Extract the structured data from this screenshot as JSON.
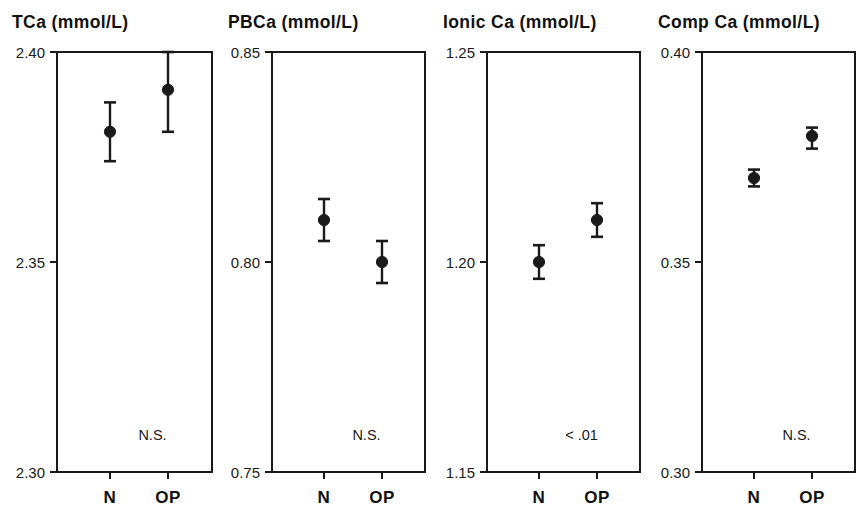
{
  "figure": {
    "caption": "",
    "background_color": "#ffffff",
    "ink_color": "#1a1a1a"
  },
  "chart_data": [
    {
      "type": "scatter",
      "title": "TCa  (mmol/L)",
      "xlabel": "",
      "ylabel": "",
      "ylim": [
        2.3,
        2.4
      ],
      "yticks": [
        2.3,
        2.35,
        2.4
      ],
      "ytick_labels": [
        "2.30",
        "2.35",
        "2.40"
      ],
      "grid": false,
      "legend": "none",
      "categories": [
        "N",
        "OP"
      ],
      "values": [
        2.381,
        2.391
      ],
      "err_low": [
        2.374,
        2.381
      ],
      "err_high": [
        2.388,
        2.4
      ],
      "annotation": "N.S."
    },
    {
      "type": "scatter",
      "title": "PBCa  (mmol/L)",
      "xlabel": "",
      "ylabel": "",
      "ylim": [
        0.75,
        0.85
      ],
      "yticks": [
        0.75,
        0.8,
        0.85
      ],
      "ytick_labels": [
        "0.75",
        "0.80",
        "0.85"
      ],
      "grid": false,
      "legend": "none",
      "categories": [
        "N",
        "OP"
      ],
      "values": [
        0.81,
        0.8
      ],
      "err_low": [
        0.805,
        0.795
      ],
      "err_high": [
        0.815,
        0.805
      ],
      "annotation": "N.S."
    },
    {
      "type": "scatter",
      "title": "Ionic  Ca  (mmol/L)",
      "xlabel": "",
      "ylabel": "",
      "ylim": [
        1.15,
        1.25
      ],
      "yticks": [
        1.15,
        1.2,
        1.25
      ],
      "ytick_labels": [
        "1.15",
        "1.20",
        "1.25"
      ],
      "grid": false,
      "legend": "none",
      "categories": [
        "N",
        "OP"
      ],
      "values": [
        1.2,
        1.21
      ],
      "err_low": [
        1.196,
        1.206
      ],
      "err_high": [
        1.204,
        1.214
      ],
      "annotation": "< .01"
    },
    {
      "type": "scatter",
      "title": "Comp  Ca  (mmol/L)",
      "xlabel": "",
      "ylabel": "",
      "ylim": [
        0.3,
        0.4
      ],
      "yticks": [
        0.3,
        0.35,
        0.4
      ],
      "ytick_labels": [
        "0.30",
        "0.35",
        "0.40"
      ],
      "grid": false,
      "legend": "none",
      "categories": [
        "N",
        "OP"
      ],
      "values": [
        0.37,
        0.38
      ],
      "err_low": [
        0.368,
        0.377
      ],
      "err_high": [
        0.372,
        0.382
      ],
      "annotation": "N.S."
    }
  ],
  "geometry": {
    "panels": [
      {
        "plot_left": 57,
        "plot_right": 212,
        "plot_top": 52,
        "plot_bottom": 472,
        "title_x": 12,
        "title_y": 28,
        "cat_x": [
          110,
          168
        ]
      },
      {
        "plot_left": 272,
        "plot_right": 425,
        "plot_top": 52,
        "plot_bottom": 472,
        "title_x": 228,
        "title_y": 28,
        "cat_x": [
          324,
          382
        ]
      },
      {
        "plot_left": 487,
        "plot_right": 640,
        "plot_top": 52,
        "plot_bottom": 472,
        "title_x": 443,
        "title_y": 28,
        "cat_x": [
          539,
          597
        ]
      },
      {
        "plot_left": 702,
        "plot_right": 855,
        "plot_top": 52,
        "plot_bottom": 472,
        "title_x": 658,
        "title_y": 28,
        "cat_x": [
          754,
          812
        ]
      }
    ],
    "marker_radius": 5.6,
    "cap_half_width": 6,
    "tick_length": 7,
    "cat_label_y": 503,
    "annotation_dy": 32
  }
}
